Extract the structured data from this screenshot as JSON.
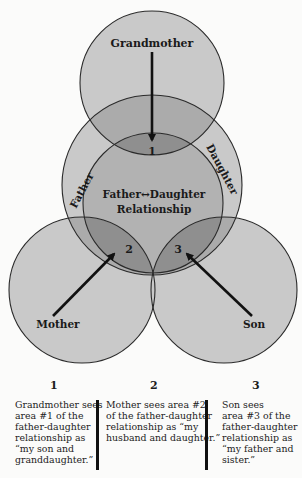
{
  "diagram": {
    "circles": [
      {
        "id": "grandmother",
        "label": "Grandmother"
      },
      {
        "id": "father-daughter-outer",
        "labels": [
          "Father",
          "Daughter"
        ]
      },
      {
        "id": "relationship",
        "label_line1": "Father↔Daughter",
        "label_line2": "Relationship"
      },
      {
        "id": "mother",
        "label": "Mother"
      },
      {
        "id": "son",
        "label": "Son"
      }
    ],
    "labels": {
      "grandmother": "Grandmother",
      "father": "Father",
      "daughter": "Daughter",
      "relationship_line1": "Father↔Daughter",
      "relationship_line2": "Relationship",
      "mother": "Mother",
      "son": "Son",
      "area1": "1",
      "area2": "2",
      "area3": "3"
    },
    "colors": {
      "single": "#c9c9c9",
      "double": "#ababab",
      "triple": "#8f8f8f",
      "stroke": "#2a2a2a"
    }
  },
  "captions": [
    {
      "number": "1",
      "text": "Grandmother sees\narea #1 of the\nfather-daughter\nrelationship as\n“my son and\ngranddaughter.”"
    },
    {
      "number": "2",
      "text": "Mother sees area #2\nof the father-daughter\nrelationship as “my\nhusband and daughter.”"
    },
    {
      "number": "3",
      "text": "Son sees\narea #3 of the\nfather-daughter\nrelationship as\n“my father and\nsister.”"
    }
  ]
}
